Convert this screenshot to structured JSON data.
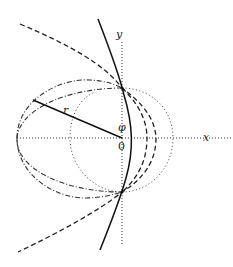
{
  "diagram": {
    "labels": {
      "x_axis": "x",
      "y_axis": "y",
      "radius": "r",
      "angle": "φ",
      "origin": "0"
    },
    "colors": {
      "stroke": "#222222",
      "background": "#ffffff"
    },
    "elements": [
      {
        "name": "x-axis",
        "style": "dotted"
      },
      {
        "name": "y-axis",
        "style": "dotted"
      },
      {
        "name": "dash-dot-circle",
        "style": "dash-dot"
      },
      {
        "name": "dotted-circle",
        "style": "dotted"
      },
      {
        "name": "dashed-curves",
        "style": "dashed"
      },
      {
        "name": "solid-curve",
        "style": "solid"
      },
      {
        "name": "radius-line",
        "style": "solid"
      }
    ]
  }
}
